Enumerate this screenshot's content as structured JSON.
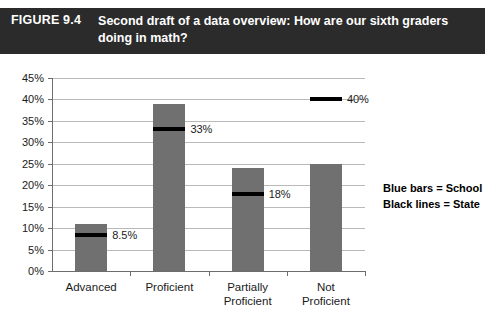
{
  "figure": {
    "number": "FIGURE 9.4",
    "title": "Second draft of a data overview: How are our sixth graders doing in math?"
  },
  "legend": {
    "line1": "Blue bars = School",
    "line2": "Black lines = State"
  },
  "colors": {
    "caption_bar": "#2b2b2b",
    "bar_fill": "#707070",
    "state_line": "#000000",
    "gridline": "#b9b9b9",
    "axis": "#6d6d6d",
    "background": "#ffffff"
  },
  "chart_data": {
    "type": "bar",
    "title": "Second draft of a data overview: How are our sixth graders doing in math?",
    "xlabel": "",
    "ylabel": "",
    "ylim": [
      0,
      45
    ],
    "ytick_labels": [
      "0%",
      "5%",
      "10%",
      "15%",
      "20%",
      "25%",
      "30%",
      "35%",
      "40%",
      "45%"
    ],
    "ytick_values": [
      0,
      5,
      10,
      15,
      20,
      25,
      30,
      35,
      40,
      45
    ],
    "grid": true,
    "legend_position": "right",
    "categories": [
      "Advanced",
      "Proficient",
      "Partially Proficient",
      "Not Proficient"
    ],
    "series": [
      {
        "name": "Blue bars = School",
        "type": "bar",
        "values": [
          11,
          39,
          24,
          25
        ]
      },
      {
        "name": "Black lines = State",
        "type": "marker-line",
        "values": [
          8.5,
          33,
          18,
          40
        ],
        "labels": [
          "8.5%",
          "33%",
          "18%",
          "40%"
        ]
      }
    ]
  }
}
